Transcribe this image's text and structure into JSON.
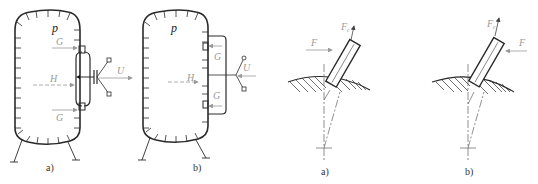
{
  "figures": [
    {
      "id": "vessel-a",
      "caption": "a)",
      "labels": {
        "pressure": "p",
        "top_force": "G",
        "bottom_force": "G",
        "horizontal_force": "H",
        "outlet_force": "U"
      }
    },
    {
      "id": "vessel-b",
      "caption": "b)",
      "labels": {
        "pressure": "p",
        "top_force": "G",
        "bottom_force": "G",
        "horizontal_force": "H",
        "outlet_force": "U"
      }
    },
    {
      "id": "nozzle-a",
      "caption": "a)",
      "labels": {
        "applied_force": "F",
        "axial_force": "F",
        "axial_force_sub": "c"
      }
    },
    {
      "id": "nozzle-b",
      "caption": "b)",
      "labels": {
        "applied_force": "F",
        "axial_force": "F",
        "axial_force_sub": "c"
      }
    }
  ],
  "colors": {
    "line": "#2a2a2a",
    "arrow": "#9a9a9a",
    "hatch": "#333333"
  }
}
